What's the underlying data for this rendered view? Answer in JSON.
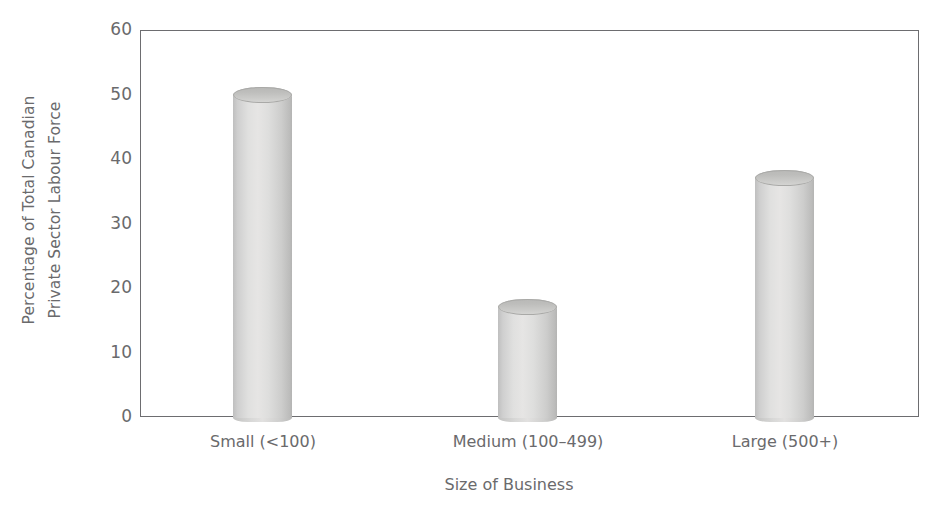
{
  "chart_data": {
    "type": "bar",
    "title": "",
    "subtitle": "",
    "xlabel": "Size of Business",
    "ylabel": "Percentage of Total Canadian Private Sector Labour Force",
    "ylabel_line1": "Percentage of Total Canadian",
    "ylabel_line2": "Private Sector Labour Force",
    "categories": [
      "Small (<100)",
      "Medium (100–499)",
      "Large (500+)"
    ],
    "values": [
      50,
      17,
      37
    ],
    "ylim": [
      0,
      60
    ],
    "y_ticks": [
      0,
      10,
      20,
      30,
      40,
      50,
      60
    ],
    "y_tick_labels": [
      "0",
      "10",
      "20",
      "30",
      "40",
      "50",
      "60"
    ],
    "grid": false,
    "legend": null,
    "legend_position": "none",
    "bar_style": "cylinder",
    "bar_color": "#d9d9d8",
    "axis_color": "#6d6d70",
    "text_color": "#6a6a6c",
    "background": "#ffffff",
    "annotations": []
  },
  "axes": {
    "y_title_line1": "Percentage of Total Canadian",
    "y_title_line2": "Private Sector Labour Force",
    "x_title": "Size of Business",
    "tick_60": "60",
    "tick_50": "50",
    "tick_40": "40",
    "tick_30": "30",
    "tick_20": "20",
    "tick_10": "10",
    "tick_0": "0"
  },
  "bars": [
    {
      "label": "Small (<100)",
      "value": 50
    },
    {
      "label": "Medium (100–499)",
      "value": 17
    },
    {
      "label": "Large (500+)",
      "value": 37
    }
  ]
}
